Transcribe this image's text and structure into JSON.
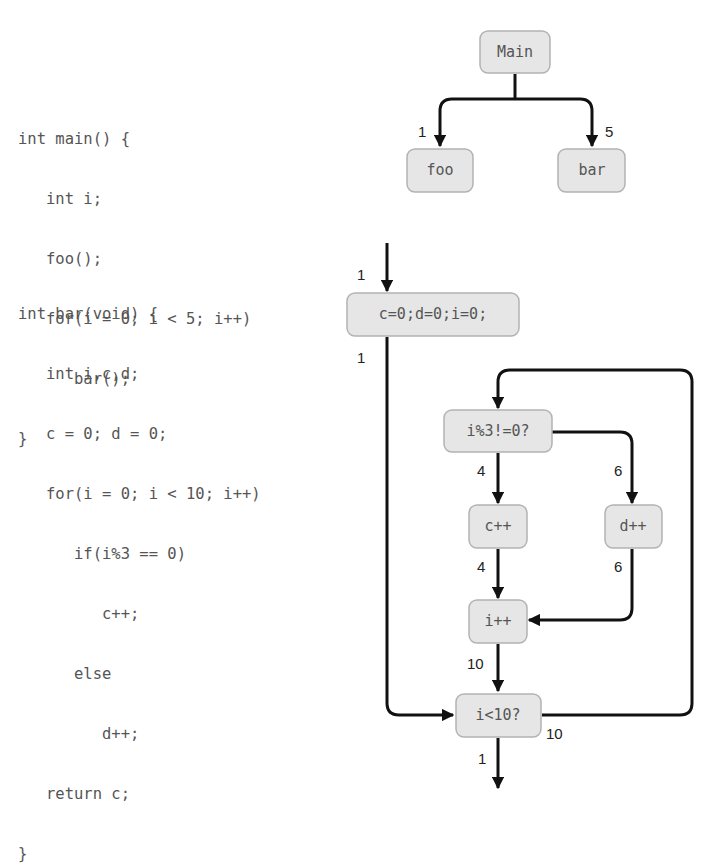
{
  "code": {
    "main": [
      "int main() {",
      "   int i;",
      "   foo();",
      "   for(i = 0; i < 5; i++)",
      "      bar();",
      "}"
    ],
    "bar": [
      "int bar(void) {",
      "   int i,c,d;",
      "   c = 0; d = 0;",
      "   for(i = 0; i < 10; i++)",
      "      if(i%3 == 0)",
      "         c++;",
      "      else",
      "         d++;",
      "   return c;",
      "}"
    ]
  },
  "call_graph": {
    "nodes": {
      "main": "Main",
      "foo": "foo",
      "bar": "bar"
    },
    "edges": [
      {
        "from": "Main",
        "to": "foo",
        "count": "1"
      },
      {
        "from": "Main",
        "to": "bar",
        "count": "5"
      }
    ]
  },
  "cfg": {
    "nodes": {
      "init": "c=0;d=0;i=0;",
      "cond_mod": "i%3!=0?",
      "inc_c": "c++",
      "inc_d": "d++",
      "inc_i": "i++",
      "cond_loop": "i<10?"
    },
    "edges": [
      {
        "from": "entry",
        "to": "c=0;d=0;i=0;",
        "count": "1"
      },
      {
        "from": "c=0;d=0;i=0;",
        "to": "i<10?",
        "count": "1"
      },
      {
        "from": "i<10?",
        "to": "i%3!=0?",
        "count": "10"
      },
      {
        "from": "i%3!=0?",
        "to": "c++",
        "count": "4"
      },
      {
        "from": "i%3!=0?",
        "to": "d++",
        "count": "6"
      },
      {
        "from": "c++",
        "to": "i++",
        "count": "4"
      },
      {
        "from": "d++",
        "to": "i++",
        "count": "6"
      },
      {
        "from": "i++",
        "to": "i<10?",
        "count": "10"
      },
      {
        "from": "i<10?",
        "to": "exit",
        "count": "1"
      }
    ]
  }
}
